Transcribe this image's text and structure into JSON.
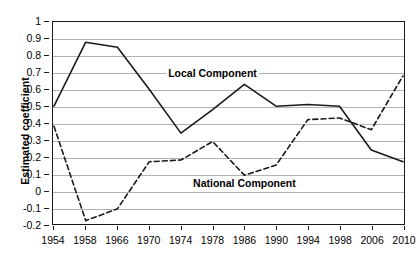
{
  "chart_data": {
    "type": "line",
    "title": "",
    "xlabel": "",
    "ylabel": "Estimated coefficient",
    "categories": [
      "1954",
      "1958",
      "1966",
      "1970",
      "1974",
      "1978",
      "1986",
      "1990",
      "1994",
      "1998",
      "2006",
      "2010"
    ],
    "ylim": [
      -0.2,
      1
    ],
    "ytick_labels": [
      "1",
      "0.9",
      "0.8",
      "0.7",
      "0.6",
      "0.5",
      "0.4",
      "0.3",
      "0.2",
      "0.1",
      "0",
      "-0.1",
      "-0.2"
    ],
    "ytick_values": [
      1,
      0.9,
      0.8,
      0.7,
      0.6,
      0.5,
      0.4,
      0.3,
      0.2,
      0.1,
      0,
      -0.1,
      -0.2
    ],
    "grid": true,
    "legend_position": "inline-annotations",
    "series": [
      {
        "name": "Local Component",
        "style": "solid",
        "color": "#1a1a1a",
        "values": [
          0.5,
          0.88,
          0.85,
          0.6,
          0.34,
          0.48,
          0.63,
          0.5,
          0.51,
          0.5,
          0.24,
          0.17
        ]
      },
      {
        "name": "National Component",
        "style": "dashed",
        "color": "#1a1a1a",
        "values": [
          0.38,
          -0.18,
          -0.11,
          0.17,
          0.18,
          0.29,
          0.09,
          0.15,
          0.42,
          0.43,
          0.36,
          0.68
        ]
      }
    ],
    "annotations": [
      {
        "text": "Local Component",
        "x_category": "1978",
        "y_value": 0.695
      },
      {
        "text": "National Component",
        "x_category": "1986",
        "y_value": 0.045
      }
    ]
  }
}
